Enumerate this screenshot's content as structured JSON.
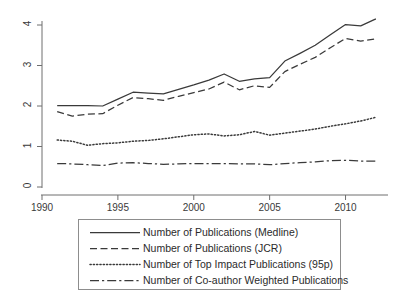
{
  "chart_data": {
    "type": "line",
    "title": "",
    "xlabel": "",
    "ylabel": "",
    "xlim": [
      1990,
      2012.6
    ],
    "ylim": [
      0,
      4.3
    ],
    "xticks": [
      1990,
      1995,
      2000,
      2005,
      2010
    ],
    "yticks": [
      0,
      1,
      2,
      3,
      4
    ],
    "grid": false,
    "legend_position": "below-axes",
    "x": [
      1991,
      1992,
      1993,
      1994,
      1995,
      1996,
      1997,
      1998,
      1999,
      2000,
      2001,
      2002,
      2003,
      2004,
      2005,
      2006,
      2007,
      2008,
      2009,
      2010,
      2011,
      2012
    ],
    "series": [
      {
        "name": "Number of Publications (Medline)",
        "style": "solid",
        "values": [
          2.01,
          2.01,
          2.01,
          2.0,
          2.17,
          2.34,
          2.32,
          2.3,
          2.41,
          2.52,
          2.64,
          2.79,
          2.61,
          2.67,
          2.7,
          3.11,
          3.3,
          3.5,
          3.76,
          4.01,
          3.98,
          4.15
        ]
      },
      {
        "name": "Number of Publications (JCR)",
        "style": "dashed",
        "values": [
          1.86,
          1.75,
          1.8,
          1.81,
          2.02,
          2.21,
          2.18,
          2.14,
          2.24,
          2.33,
          2.42,
          2.59,
          2.4,
          2.5,
          2.46,
          2.85,
          3.03,
          3.2,
          3.44,
          3.67,
          3.6,
          3.66
        ]
      },
      {
        "name": "Number of Top Impact Publications (95p)",
        "style": "dotted",
        "values": [
          1.16,
          1.13,
          1.03,
          1.07,
          1.09,
          1.13,
          1.15,
          1.19,
          1.24,
          1.29,
          1.31,
          1.26,
          1.29,
          1.37,
          1.28,
          1.33,
          1.38,
          1.43,
          1.5,
          1.56,
          1.63,
          1.72
        ]
      },
      {
        "name": "Number of Co-author Weighted Publications",
        "style": "dashdot",
        "values": [
          0.58,
          0.57,
          0.55,
          0.53,
          0.59,
          0.6,
          0.58,
          0.56,
          0.57,
          0.58,
          0.58,
          0.58,
          0.57,
          0.57,
          0.55,
          0.58,
          0.6,
          0.62,
          0.65,
          0.66,
          0.64,
          0.64
        ]
      }
    ]
  },
  "axes": {
    "ytick_labels": [
      "0",
      "1",
      "2",
      "3",
      "4"
    ],
    "xtick_labels": [
      "1990",
      "1995",
      "2000",
      "2005",
      "2010"
    ]
  },
  "legend": {
    "entries": [
      {
        "label": "Number of Publications (Medline)",
        "style": "solid"
      },
      {
        "label": "Number of Publications (JCR)",
        "style": "dashed"
      },
      {
        "label": "Number of Top Impact Publications (95p)",
        "style": "dotted"
      },
      {
        "label": "Number of Co-author Weighted Publications",
        "style": "dashdot"
      }
    ]
  },
  "colors": {
    "line": "#3a3a3a",
    "axis": "#6e6e6e",
    "legend_border": "#8d8d8d",
    "background": "#ffffff"
  }
}
